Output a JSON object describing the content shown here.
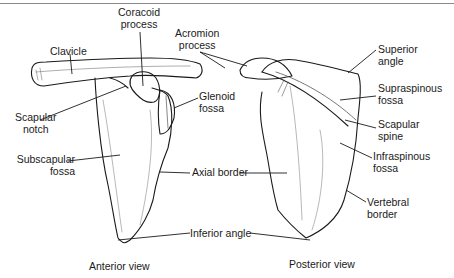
{
  "figure": {
    "views": {
      "anterior": "Anterior view",
      "posterior": "Posterior view"
    },
    "labels": {
      "coracoid_1": "Coracoid",
      "coracoid_2": "process",
      "acromion_1": "Acromion",
      "acromion_2": "process",
      "clavicle": "Clavicle",
      "scapular_notch_1": "Scapular",
      "scapular_notch_2": "notch",
      "glenoid_1": "Glenoid",
      "glenoid_2": "fossa",
      "subscapular_1": "Subscapular",
      "subscapular_2": "fossa",
      "axial_border": "Axial border",
      "inferior_angle": "Inferior angle",
      "superior_angle_1": "Superior",
      "superior_angle_2": "angle",
      "supraspinous_1": "Supraspinous",
      "supraspinous_2": "fossa",
      "scapular_spine_1": "Scapular",
      "scapular_spine_2": "spine",
      "infraspinous_1": "Infraspinous",
      "infraspinous_2": "fossa",
      "vertebral_1": "Vertebral",
      "vertebral_2": "border"
    }
  }
}
